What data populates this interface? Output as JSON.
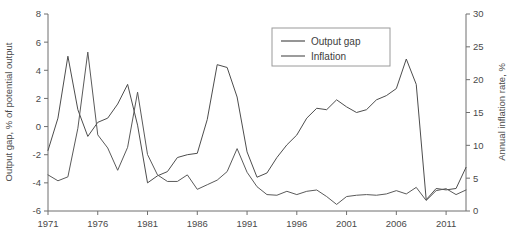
{
  "chart_data": {
    "type": "line",
    "title": "",
    "subtitle": "",
    "xlabel": "",
    "ylabel": "Output gap, % of potential output",
    "y2label": "Annual inflation rate, %",
    "grid": false,
    "legend_position": "top-center-right",
    "xlim": [
      1971,
      2013
    ],
    "ylim": [
      -6,
      8
    ],
    "y2lim": [
      0,
      30
    ],
    "yticks": [
      -6,
      -4,
      -2,
      0,
      2,
      4,
      6,
      8
    ],
    "y2ticks": [
      0,
      5,
      10,
      15,
      20,
      25,
      30
    ],
    "xticks": [
      1971,
      1976,
      1981,
      1986,
      1991,
      1996,
      2001,
      2006,
      2011
    ],
    "xticklabels": [
      "1971",
      "1976",
      "1981",
      "1986",
      "1991",
      "1996",
      "2001",
      "2006",
      "2011"
    ],
    "yticklabels": [
      "-6",
      "-4",
      "-2",
      "0",
      "2",
      "4",
      "6",
      "8"
    ],
    "y2ticklabels": [
      "0",
      "5",
      "10",
      "15",
      "20",
      "25",
      "30"
    ],
    "x": [
      1971,
      1972,
      1973,
      1974,
      1975,
      1976,
      1977,
      1978,
      1979,
      1980,
      1981,
      1982,
      1983,
      1984,
      1985,
      1986,
      1987,
      1988,
      1989,
      1990,
      1991,
      1992,
      1993,
      1994,
      1995,
      1996,
      1997,
      1998,
      1999,
      2000,
      2001,
      2002,
      2003,
      2004,
      2005,
      2006,
      2007,
      2008,
      2009,
      2010,
      2011,
      2012,
      2013
    ],
    "series": [
      {
        "name": "Output gap",
        "axis": "left",
        "color": "#4d4d4d",
        "units": "% of potential output",
        "values": [
          -1.7,
          0.6,
          5.0,
          1.2,
          -0.7,
          0.3,
          0.6,
          1.6,
          3.0,
          0.1,
          -4.0,
          -3.5,
          -3.2,
          -2.2,
          -2.0,
          -1.9,
          0.5,
          4.4,
          4.2,
          2.1,
          -1.8,
          -3.6,
          -3.3,
          -2.2,
          -1.3,
          -0.6,
          0.6,
          1.3,
          1.2,
          1.9,
          1.4,
          1.0,
          1.2,
          1.9,
          2.2,
          2.7,
          4.8,
          3.0,
          -5.2,
          -4.4,
          -4.5,
          -4.4,
          -2.9
        ]
      },
      {
        "name": "Inflation",
        "axis": "right",
        "color": "#5a5a5a",
        "units": "% annual",
        "values": [
          5.5,
          4.6,
          5.2,
          12.6,
          24.2,
          11.6,
          9.6,
          6.2,
          9.7,
          18.1,
          8.6,
          5.5,
          4.5,
          4.5,
          5.5,
          3.3,
          4.0,
          4.7,
          6.0,
          9.5,
          5.9,
          3.7,
          2.5,
          2.4,
          3.0,
          2.5,
          3.0,
          3.2,
          2.2,
          1.0,
          2.2,
          2.4,
          2.5,
          2.4,
          2.6,
          3.1,
          2.6,
          3.6,
          1.6,
          3.1,
          3.4,
          2.5,
          3.2
        ]
      }
    ]
  },
  "legend": {
    "items": [
      {
        "label": "Output gap"
      },
      {
        "label": "Inflation"
      }
    ]
  }
}
